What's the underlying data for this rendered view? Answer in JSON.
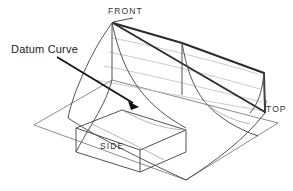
{
  "drawing": {
    "title_labels": {
      "front": "FRONT",
      "top": "TOP",
      "side": "SIDE"
    },
    "annotation": {
      "label": "Datum Curve",
      "leader_start_x": 57,
      "leader_start_y": 57,
      "leader_end_x": 137,
      "leader_end_y": 106
    },
    "colors": {
      "background": "#ffffff",
      "outline": "#4a4a4a",
      "ridge": "#2b2b2b",
      "mesh": "#b9b9b9",
      "text": "#262626",
      "leader": "#111111"
    },
    "geometry": {
      "type": "isometric-wireframe-surface",
      "apex_front": [
        112,
        22
      ],
      "vertex_top": [
        265,
        113
      ],
      "base_left": [
        34,
        125
      ],
      "base_bottom": [
        186,
        180
      ],
      "base_right": [
        278,
        123
      ],
      "description": "Lofted surface with S-shaped cross-section profiles swept between a front apex edge and a top right vertex, resting on a parallelogram base plane."
    }
  }
}
